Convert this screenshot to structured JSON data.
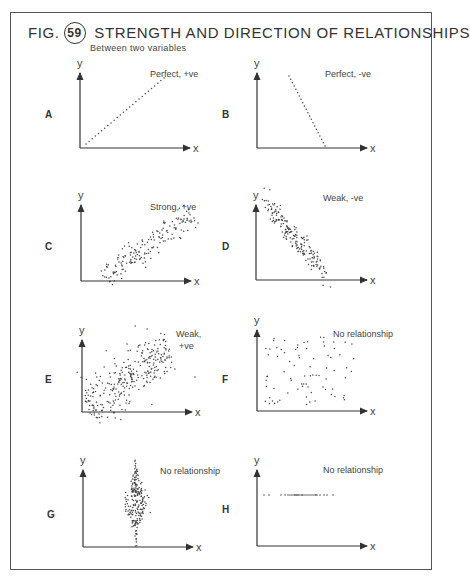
{
  "figure": {
    "prefix": "FIG.",
    "number": "59",
    "title": "STRENGTH AND DIRECTION OF RELATIONSHIPS",
    "subtitle": "Between two variables"
  },
  "chart_data": [
    {
      "panel": "A",
      "type": "scatter",
      "label": "Perfect, +ve",
      "xlabel": "x",
      "ylabel": "y",
      "pattern": "perfect_positive",
      "grid": false
    },
    {
      "panel": "B",
      "type": "scatter",
      "label": "Perfect, -ve",
      "xlabel": "x",
      "ylabel": "y",
      "pattern": "perfect_negative",
      "grid": false
    },
    {
      "panel": "C",
      "type": "scatter",
      "label": "Strong, +ve",
      "xlabel": "x",
      "ylabel": "y",
      "pattern": "strong_positive",
      "grid": false
    },
    {
      "panel": "D",
      "type": "scatter",
      "label": "Weak, -ve",
      "xlabel": "x",
      "ylabel": "y",
      "pattern": "weak_negative",
      "grid": false
    },
    {
      "panel": "E",
      "type": "scatter",
      "label": "Weak, +ve",
      "xlabel": "x",
      "ylabel": "y",
      "pattern": "weak_positive",
      "grid": false
    },
    {
      "panel": "F",
      "type": "scatter",
      "label": "No relationship",
      "xlabel": "x",
      "ylabel": "y",
      "pattern": "random",
      "grid": false
    },
    {
      "panel": "G",
      "type": "scatter",
      "label": "No relationship",
      "xlabel": "x",
      "ylabel": "y",
      "pattern": "vertical_cluster",
      "grid": false
    },
    {
      "panel": "H",
      "type": "scatter",
      "label": "No relationship",
      "xlabel": "x",
      "ylabel": "y",
      "pattern": "horizontal_line",
      "grid": false
    }
  ]
}
